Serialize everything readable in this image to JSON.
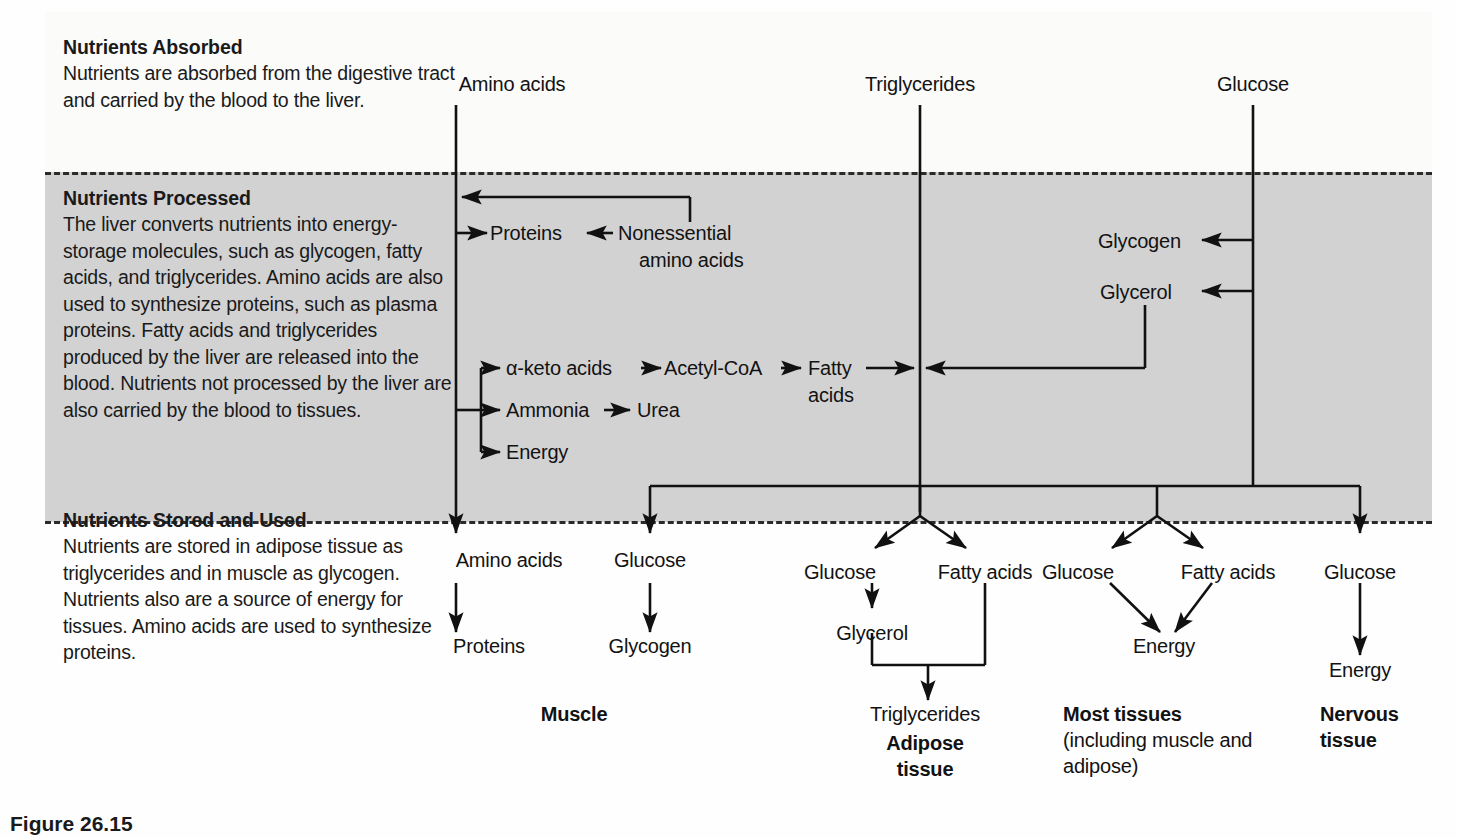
{
  "figure": {
    "caption": "Figure 26.15"
  },
  "sections": [
    {
      "id": "absorbed",
      "heading": "Nutrients Absorbed",
      "body": "Nutrients are absorbed from the digestive tract and carried by the blood to the liver."
    },
    {
      "id": "processed",
      "heading": "Nutrients Processed",
      "body": "The liver converts nutrients into energy-storage molecules, such as glycogen, fatty acids, and triglycerides. Amino acids are also used to synthesize proteins, such as plasma proteins. Fatty acids and triglycerides produced by the liver are released into the blood. Nutrients not processed by the liver are also carried by the blood to tissues."
    },
    {
      "id": "stored",
      "heading": "Nutrients Stored and Used",
      "body": "Nutrients are stored in adipose tissue as triglycerides and in muscle as glycogen. Nutrients also are a source of energy for tissues. Amino acids are used to synthesize proteins."
    }
  ],
  "nodes": {
    "top": [
      {
        "id": "top-amino",
        "label": "Amino acids"
      },
      {
        "id": "top-trig",
        "label": "Triglycerides"
      },
      {
        "id": "top-glucose",
        "label": "Glucose"
      }
    ],
    "processed": [
      {
        "id": "proc-proteins",
        "label": "Proteins"
      },
      {
        "id": "proc-noness-1",
        "label": "Nonessential"
      },
      {
        "id": "proc-noness-2",
        "label": "amino acids"
      },
      {
        "id": "proc-glycogen",
        "label": "Glycogen"
      },
      {
        "id": "proc-glycerol",
        "label": "Glycerol"
      },
      {
        "id": "proc-ketoacids",
        "label": "α-keto acids"
      },
      {
        "id": "proc-acetylcoa",
        "label": "Acetyl-CoA"
      },
      {
        "id": "proc-fatty-1",
        "label": "Fatty"
      },
      {
        "id": "proc-fatty-2",
        "label": "acids"
      },
      {
        "id": "proc-ammonia",
        "label": "Ammonia"
      },
      {
        "id": "proc-urea",
        "label": "Urea"
      },
      {
        "id": "proc-energy",
        "label": "Energy"
      }
    ],
    "stored": [
      {
        "id": "st-amino",
        "label": "Amino acids"
      },
      {
        "id": "st-proteins",
        "label": "Proteins"
      },
      {
        "id": "st-glucose-m",
        "label": "Glucose"
      },
      {
        "id": "st-glycogen-m",
        "label": "Glycogen"
      },
      {
        "id": "st-glucose-a",
        "label": "Glucose"
      },
      {
        "id": "st-fatty-a",
        "label": "Fatty acids"
      },
      {
        "id": "st-glycerol-a",
        "label": "Glycerol"
      },
      {
        "id": "st-trig-a",
        "label": "Triglycerides"
      },
      {
        "id": "st-glucose-t",
        "label": "Glucose"
      },
      {
        "id": "st-fatty-t",
        "label": "Fatty acids"
      },
      {
        "id": "st-energy-t",
        "label": "Energy"
      },
      {
        "id": "st-glucose-n",
        "label": "Glucose"
      },
      {
        "id": "st-energy-n",
        "label": "Energy"
      }
    ],
    "tissues": [
      {
        "id": "tis-muscle",
        "label": "Muscle"
      },
      {
        "id": "tis-adipose1",
        "label": "Adipose"
      },
      {
        "id": "tis-adipose2",
        "label": "tissue"
      },
      {
        "id": "tis-most",
        "label": "Most tissues"
      },
      {
        "id": "tis-most-sub1",
        "label": "(including muscle and"
      },
      {
        "id": "tis-most-sub2",
        "label": "adipose)"
      },
      {
        "id": "tis-nerv1",
        "label": "Nervous"
      },
      {
        "id": "tis-nerv2",
        "label": "tissue"
      }
    ]
  },
  "colors": {
    "band_processed": "#d2d2d2",
    "page_background": "#fefefe",
    "line": "#111111",
    "text": "#121212"
  }
}
